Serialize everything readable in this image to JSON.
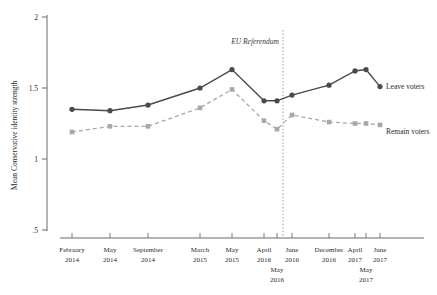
{
  "chart_data": {
    "type": "line",
    "title": "",
    "xlabel": "",
    "ylabel": "Mean Conservative identity strength",
    "ylim": [
      0.5,
      2
    ],
    "yticks": [
      2,
      1.5,
      1,
      0.5
    ],
    "ytick_labels": [
      "2",
      "1.5",
      "1",
      ".5"
    ],
    "grid": false,
    "legend_position": "inline-right",
    "categories": [
      "February 2014",
      "May 2014",
      "September 2014",
      "March 2015",
      "May 2015",
      "April 2016",
      "May 2016",
      "June 2016",
      "December 2016",
      "April 2017",
      "May 2017",
      "June 2017"
    ],
    "x_tick_lines": [
      {
        "top": "February",
        "bottom": "2014",
        "second_top": "",
        "second_bottom": ""
      },
      {
        "top": "May",
        "bottom": "2014",
        "second_top": "",
        "second_bottom": ""
      },
      {
        "top": "September",
        "bottom": "2014",
        "second_top": "",
        "second_bottom": ""
      },
      {
        "top": "March",
        "bottom": "2015",
        "second_top": "",
        "second_bottom": ""
      },
      {
        "top": "May",
        "bottom": "2015",
        "second_top": "",
        "second_bottom": ""
      },
      {
        "top": "April",
        "bottom": "2016",
        "second_top": "",
        "second_bottom": ""
      },
      {
        "top": "",
        "bottom": "",
        "second_top": "May",
        "second_bottom": "2016"
      },
      {
        "top": "June",
        "bottom": "2016",
        "second_top": "",
        "second_bottom": ""
      },
      {
        "top": "December",
        "bottom": "2016",
        "second_top": "",
        "second_bottom": ""
      },
      {
        "top": "April",
        "bottom": "2017",
        "second_top": "",
        "second_bottom": ""
      },
      {
        "top": "",
        "bottom": "",
        "second_top": "May",
        "second_bottom": "2017"
      },
      {
        "top": "June",
        "bottom": "2017",
        "second_top": "",
        "second_bottom": ""
      }
    ],
    "series": [
      {
        "name": "Leave voters",
        "color": "#4a4a4a",
        "marker": "circle",
        "linestyle": "solid",
        "values": [
          1.35,
          1.34,
          1.38,
          1.5,
          1.63,
          1.41,
          1.41,
          1.45,
          1.52,
          1.62,
          1.63,
          1.51
        ]
      },
      {
        "name": "Remain voters",
        "color": "#a8a8a8",
        "marker": "square",
        "linestyle": "dashed",
        "values": [
          1.19,
          1.23,
          1.23,
          1.36,
          1.49,
          1.27,
          1.21,
          1.31,
          1.26,
          1.25,
          1.25,
          1.24
        ]
      }
    ],
    "annotations": [
      {
        "text": "EU Referendum",
        "at_category": "June 2016",
        "style": "italic-vertical-rule"
      }
    ]
  },
  "axis": {
    "y_title": "Mean Conservative identity strength",
    "y_labels": [
      "2",
      "1.5",
      "1",
      ".5"
    ]
  },
  "annotation": {
    "referendum": "EU Referendum"
  },
  "series_labels": {
    "leave": "Leave voters",
    "remain": "Remain voters"
  }
}
